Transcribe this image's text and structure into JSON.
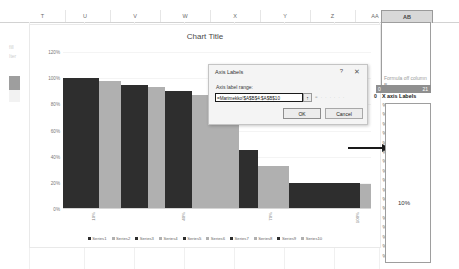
{
  "spreadsheet": {
    "columns": [
      {
        "label": "T",
        "selected": false
      },
      {
        "label": "U",
        "selected": false
      },
      {
        "label": "V",
        "selected": false
      },
      {
        "label": "W",
        "selected": false
      },
      {
        "label": "X",
        "selected": false
      },
      {
        "label": "Y",
        "selected": false
      },
      {
        "label": "Z",
        "selected": false
      },
      {
        "label": "AA",
        "selected": false
      },
      {
        "label": "AB",
        "selected": true
      }
    ],
    "note_cell": "Formula off column B",
    "highlight_row": {
      "left": "0",
      "right": "21"
    },
    "x_axis_labels_header": {
      "prefix": "0",
      "text": "X axis Labels"
    },
    "percent_column": [
      "%",
      "%",
      "%",
      "%",
      "%",
      "%",
      "%",
      "%",
      "%",
      "%",
      "%",
      "%",
      "%",
      "%",
      "%",
      "%",
      "%"
    ],
    "sample_value": "10%",
    "left_faint": [
      "fill",
      "Iter"
    ]
  },
  "dialog": {
    "title": "Axis Labels",
    "help_icon": "?",
    "close_icon": "✕",
    "field_label": "Axis label range:",
    "field_value": "=Marimekko!$A$B$4:$A$B$10",
    "field_placeholder": "Axis label range",
    "picker_icon": "↑",
    "preview_text": "= . . . . . .",
    "ok_label": "OK",
    "cancel_label": "Cancel"
  },
  "colors": {
    "dark_series": "#2e2e2e",
    "light_series": "#b0b0b0",
    "arrow": "#1a1a1a",
    "selection": "#8f8f8f"
  },
  "chart_data": {
    "type": "bar",
    "title": "Chart Title",
    "xlabel": "",
    "ylabel": "",
    "ylim": [
      0,
      1.2
    ],
    "ytick_labels": [
      "120%",
      "100%",
      "80%",
      "60%",
      "40%",
      "20%",
      "0%"
    ],
    "ytick_values": [
      1.2,
      1.0,
      0.8,
      0.6,
      0.4,
      0.2,
      0.0
    ],
    "xtick_labels": [
      "10%",
      "40%",
      "70%",
      "100%"
    ],
    "grid": false,
    "legend_position": "bottom",
    "legend": [
      "Series1",
      "Series2",
      "Series3",
      "Series4",
      "Series5",
      "Series6",
      "Series7",
      "Series8",
      "Series9",
      "Series10"
    ],
    "categories": [
      "Series1",
      "Series2",
      "Series3",
      "Series4",
      "Series5",
      "Series6",
      "Series7",
      "Series8",
      "Series9",
      "Series10"
    ],
    "values": [
      1.0,
      0.98,
      0.95,
      0.93,
      0.9,
      0.87,
      0.45,
      0.33,
      0.2,
      0.19
    ],
    "widths": [
      13,
      8,
      10,
      6,
      10,
      17,
      7,
      11,
      26,
      4
    ],
    "series_colors": [
      "#2e2e2e",
      "#b0b0b0",
      "#2e2e2e",
      "#b0b0b0",
      "#2e2e2e",
      "#b0b0b0",
      "#2e2e2e",
      "#b0b0b0",
      "#2e2e2e",
      "#b0b0b0"
    ]
  }
}
